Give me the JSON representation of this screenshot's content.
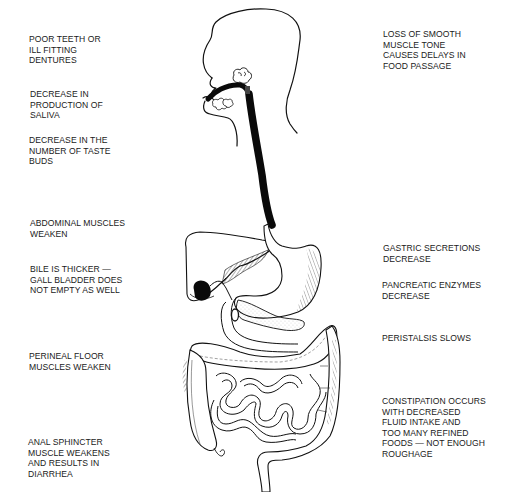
{
  "diagram": {
    "left_labels": [
      {
        "id": "teeth",
        "lines": [
          "POOR TEETH OR",
          "ILL FITTING",
          "DENTURES"
        ]
      },
      {
        "id": "saliva",
        "lines": [
          "DECREASE IN",
          "PRODUCTION OF",
          "SALIVA"
        ]
      },
      {
        "id": "taste",
        "lines": [
          "DECREASE IN THE",
          "NUMBER OF TASTE",
          "BUDS"
        ]
      },
      {
        "id": "abdominal",
        "lines": [
          "ABDOMINAL MUSCLES",
          "WEAKEN"
        ]
      },
      {
        "id": "bile",
        "lines": [
          "BILE IS THICKER —",
          "GALL BLADDER DOES",
          "NOT EMPTY AS WELL"
        ]
      },
      {
        "id": "perineal",
        "lines": [
          "PERINEAL FLOOR",
          "MUSCLES WEAKEN"
        ]
      },
      {
        "id": "anal",
        "lines": [
          "ANAL SPHINCTER",
          "MUSCLE WEAKENS",
          "AND RESULTS IN",
          "DIARRHEA"
        ]
      }
    ],
    "right_labels": [
      {
        "id": "smooth_muscle",
        "lines": [
          "LOSS OF SMOOTH",
          "MUSCLE TONE",
          "CAUSES DELAYS IN",
          "FOOD PASSAGE"
        ]
      },
      {
        "id": "gastric",
        "lines": [
          "GASTRIC SECRETIONS",
          "DECREASE"
        ]
      },
      {
        "id": "pancreatic",
        "lines": [
          "PANCREATIC ENZYMES",
          "DECREASE"
        ]
      },
      {
        "id": "peristalsis",
        "lines": [
          "PERISTALSIS SLOWS"
        ]
      },
      {
        "id": "constipation",
        "lines": [
          "CONSTIPATION OCCURS",
          "WITH DECREASED",
          "FLUID INTAKE AND",
          "TOO MANY REFINED",
          "FOODS — NOT ENOUGH",
          "ROUGHAGE"
        ]
      }
    ],
    "colors": {
      "ink": "#111111",
      "text": "#1a1a1a",
      "background": "#ffffff"
    }
  }
}
